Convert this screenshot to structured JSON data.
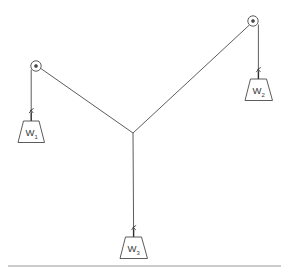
{
  "diagram": {
    "background_color": "#ffffff",
    "line_color": "#4a4a4a",
    "ground_color": "#8c8c8c",
    "label_color": "#3a3a3a",
    "weights": [
      {
        "id": "w1",
        "label": "W",
        "subscript": "1",
        "x": 33,
        "y": 132
      },
      {
        "id": "w2",
        "label": "W",
        "subscript": "2",
        "x": 259,
        "y": 91
      },
      {
        "id": "w3",
        "label": "W",
        "subscript": "3",
        "x": 136,
        "y": 249
      }
    ],
    "pulleys": [
      {
        "id": "pulley-left",
        "cx": 36,
        "cy": 66,
        "r": 5.2,
        "hub_r": 1.6
      },
      {
        "id": "pulley-right",
        "cx": 253,
        "cy": 21,
        "r": 5.2,
        "hub_r": 1.6
      }
    ],
    "junction": {
      "x": 133,
      "y": 133
    },
    "ropes": [
      {
        "id": "rope-left-span",
        "from": "pulley-left",
        "to": "junction"
      },
      {
        "id": "rope-right-span",
        "from": "pulley-right",
        "to": "junction"
      },
      {
        "id": "rope-w1-hang",
        "from": "pulley-left",
        "to": "w1"
      },
      {
        "id": "rope-w2-hang",
        "from": "pulley-right",
        "to": "w2"
      },
      {
        "id": "rope-w3-hang",
        "from": "junction",
        "to": "w3"
      }
    ],
    "ground": {
      "y": 266,
      "x_start": 8,
      "x_end": 281
    }
  }
}
